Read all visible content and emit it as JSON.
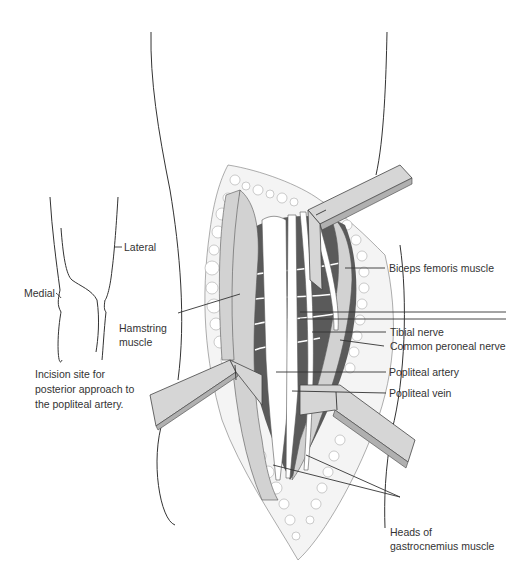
{
  "figure": {
    "type": "anatomical-surgical-illustration",
    "subject": "Posterior approach to the popliteal artery"
  },
  "inset": {
    "labels": {
      "lateral": "Lateral",
      "medial": "Medial"
    },
    "caption_lines": [
      "Incision site for",
      "posterior approach to",
      "the popliteal artery."
    ]
  },
  "main": {
    "labels": {
      "hamstring_line1": "Hamstring",
      "hamstring_line2": "muscle",
      "biceps_femoris": "Biceps femoris muscle",
      "tibial_nerve": "Tibial nerve",
      "common_peroneal_nerve": "Common peroneal nerve",
      "popliteal_artery": "Popliteal artery",
      "popliteal_vein": "Popliteal vein",
      "gastrocnemius_line1": "Heads of",
      "gastrocnemius_line2": "gastrocnemius muscle"
    }
  },
  "colors": {
    "outline": "#333333",
    "muscle_dark": "#5a5a5a",
    "muscle_light": "#d2d2d2",
    "retractor": "#d6d6d6",
    "fat": "#f4f4f4",
    "text": "#333333"
  }
}
